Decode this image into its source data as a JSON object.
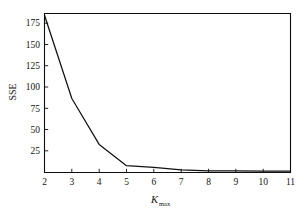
{
  "chart_data": {
    "type": "line",
    "title": "",
    "subtitle": "",
    "xlabel": "K_max",
    "xlabel_base": "K",
    "xlabel_sub": "max",
    "ylabel": "SSE",
    "x": [
      2,
      3,
      4,
      5,
      6,
      7,
      8,
      9,
      10,
      11
    ],
    "values": [
      185,
      87,
      33,
      8,
      6,
      3,
      2,
      2,
      1.5,
      1.5
    ],
    "series": [
      {
        "name": "SSE",
        "values": [
          185,
          87,
          33,
          8,
          6,
          3,
          2,
          2,
          1.5,
          1.5
        ]
      }
    ],
    "xlim": [
      2,
      11
    ],
    "ylim": [
      0,
      187
    ],
    "xticks": [
      2,
      3,
      4,
      5,
      6,
      7,
      8,
      9,
      10,
      11
    ],
    "yticks": [
      25,
      50,
      75,
      100,
      125,
      150,
      175
    ],
    "xtick_labels": [
      "2",
      "3",
      "4",
      "5",
      "6",
      "7",
      "8",
      "9",
      "10",
      "11"
    ],
    "ytick_labels": [
      "25",
      "50",
      "75",
      "100",
      "125",
      "150",
      "175"
    ],
    "grid": false,
    "legend": null,
    "legend_position": "none",
    "line_color": "#111111",
    "frame_color": "#0d0d0d",
    "background_color": "#ffffff",
    "annotations": []
  },
  "axes": {
    "y_title": "SSE",
    "x_title_base": "K",
    "x_title_sub": "max"
  }
}
